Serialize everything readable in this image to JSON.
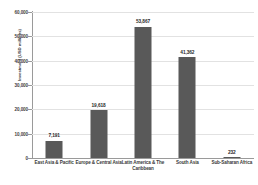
{
  "chart_data": {
    "type": "bar",
    "title": "",
    "subtitle": "",
    "xlabel": "",
    "ylabel": "Investment (USD millions)",
    "categories": [
      "East Asia & Pacific",
      "Europe & Central Asia",
      "Latin America & The Caribbean",
      "South Asia",
      "Sub-Saharan Africa"
    ],
    "values": [
      7191,
      19618,
      53867,
      41362,
      232
    ],
    "data_labels": [
      "7,191",
      "19,618",
      "53,867",
      "41,362",
      "232"
    ],
    "ylim": [
      0,
      60000
    ],
    "yticks": [
      0,
      10000,
      20000,
      30000,
      40000,
      50000,
      60000
    ],
    "ytick_labels": [
      "0",
      "10,000",
      "20,000",
      "30,000",
      "40,000",
      "50,000",
      "60,000"
    ],
    "grid": true,
    "grid_axis": "y",
    "legend": false,
    "legend_position": "none",
    "bar_color": "#595959",
    "gridline_color": "#e2e2e2",
    "axis_color": "#9a9a9a",
    "background_color": "#ffffff",
    "text_color": "#404040"
  }
}
